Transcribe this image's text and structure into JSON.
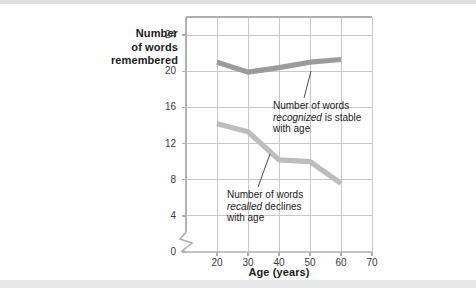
{
  "chart_data": {
    "type": "line",
    "title": "",
    "xlabel": "Age (years)",
    "ylabel": "Number of words remembered",
    "ylabel_lines": [
      "Number",
      "of words",
      "remembered"
    ],
    "x": [
      20,
      30,
      40,
      50,
      60
    ],
    "xlim": [
      10,
      70
    ],
    "ylim": [
      0,
      26
    ],
    "xticks": [
      20,
      30,
      40,
      50,
      60,
      70
    ],
    "xtick_labels": [
      "20",
      "30",
      "40",
      "50",
      "60",
      "70"
    ],
    "yticks": [
      0,
      4,
      8,
      12,
      16,
      20,
      24
    ],
    "ytick_labels": [
      "0",
      "4",
      "8",
      "12",
      "16",
      "20",
      "24"
    ],
    "grid": true,
    "legend": "none",
    "axis_break": "y-axis zigzag between 0 and 4",
    "series": [
      {
        "name": "Number of words recognized",
        "color": "#9b9b9b",
        "values": [
          21.0,
          19.9,
          20.4,
          21.0,
          21.3
        ]
      },
      {
        "name": "Number of words recalled",
        "color": "#bdbdbd",
        "values": [
          14.2,
          13.3,
          10.2,
          10.0,
          7.6
        ]
      }
    ],
    "annotations": [
      {
        "id": "recognized",
        "lines": [
          {
            "pre": "Number of words",
            "em": "",
            "post": ""
          },
          {
            "pre": "",
            "em": "recognized",
            "post": " is stable"
          },
          {
            "pre": "with age",
            "em": "",
            "post": ""
          }
        ],
        "points_to_series": "Number of words recognized"
      },
      {
        "id": "recalled",
        "lines": [
          {
            "pre": "Number of words",
            "em": "",
            "post": ""
          },
          {
            "pre": "",
            "em": "recalled",
            "post": " declines"
          },
          {
            "pre": "with age",
            "em": "",
            "post": ""
          }
        ],
        "points_to_series": "Number of words recalled"
      }
    ]
  },
  "colors": {
    "grid": "#c9c9c9",
    "axis": "#b0b0b0",
    "text": "#1b1b1b",
    "recognized_line": "#9b9b9b",
    "recalled_line": "#bdbdbd",
    "band": "#e4e5e7"
  }
}
